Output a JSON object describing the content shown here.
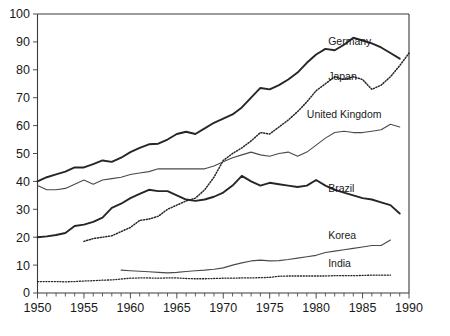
{
  "chart_data": {
    "type": "line",
    "title": "",
    "subtitle": "",
    "xlabel": "",
    "ylabel": "",
    "xlim": [
      1950,
      1990
    ],
    "ylim": [
      0,
      100
    ],
    "grid": false,
    "legend_position": "inline-right-labels",
    "x_ticks_major": [
      1950,
      1955,
      1960,
      1965,
      1970,
      1975,
      1980,
      1985,
      1990
    ],
    "x_tick_labels": [
      "1950",
      "1955",
      "1960",
      "1965",
      "1970",
      "1975",
      "1980",
      "1985",
      "1990"
    ],
    "x_tick_minor_step": 1,
    "y_ticks": [
      0,
      10,
      20,
      30,
      40,
      50,
      60,
      70,
      80,
      90,
      100
    ],
    "y_tick_labels": [
      "0",
      "10",
      "20",
      "30",
      "40",
      "50",
      "60",
      "70",
      "80",
      "90",
      "100"
    ],
    "series": [
      {
        "name": "Germany",
        "label": "Germany",
        "style": "solid-thick",
        "color": "#262626",
        "width": 1.9,
        "label_x": 1981.3,
        "label_y": 90.0,
        "x": [
          1950,
          1951,
          1952,
          1953,
          1954,
          1955,
          1956,
          1957,
          1958,
          1959,
          1960,
          1961,
          1962,
          1963,
          1964,
          1965,
          1966,
          1967,
          1968,
          1969,
          1970,
          1971,
          1972,
          1973,
          1974,
          1975,
          1976,
          1977,
          1978,
          1979,
          1980,
          1981,
          1982,
          1983,
          1984,
          1985,
          1986,
          1987,
          1988,
          1989
        ],
        "y": [
          40.0,
          41.5,
          42.5,
          43.5,
          45.0,
          45.0,
          46.2,
          47.5,
          47.0,
          48.5,
          50.5,
          52.0,
          53.3,
          53.5,
          55.0,
          57.0,
          57.8,
          57.0,
          59.0,
          61.0,
          62.5,
          64.0,
          66.5,
          70.0,
          73.5,
          73.0,
          74.5,
          76.5,
          79.0,
          82.5,
          85.5,
          87.5,
          87.0,
          89.0,
          91.5,
          90.5,
          89.5,
          88.0,
          86.0,
          84.0
        ]
      },
      {
        "name": "Japan",
        "label": "Japan",
        "style": "dotted",
        "color": "#262626",
        "width": 1.5,
        "label_x": 1981.3,
        "label_y": 77.5,
        "x": [
          1955,
          1956,
          1957,
          1958,
          1959,
          1960,
          1961,
          1962,
          1963,
          1964,
          1965,
          1966,
          1967,
          1968,
          1969,
          1970,
          1971,
          1972,
          1973,
          1974,
          1975,
          1976,
          1977,
          1978,
          1979,
          1980,
          1981,
          1982,
          1983,
          1984,
          1985,
          1986,
          1987,
          1988,
          1989,
          1990
        ],
        "y": [
          18.5,
          19.5,
          20.0,
          20.5,
          22.0,
          23.5,
          26.0,
          26.5,
          27.5,
          30.0,
          31.5,
          33.0,
          34.0,
          37.0,
          41.5,
          47.5,
          50.0,
          52.0,
          54.5,
          57.5,
          57.0,
          59.5,
          62.0,
          65.0,
          68.5,
          72.5,
          75.0,
          77.5,
          76.5,
          77.5,
          76.5,
          73.0,
          74.5,
          77.5,
          81.5,
          86.0
        ]
      },
      {
        "name": "United Kingdom",
        "label": "United Kingdom",
        "style": "solid-thin",
        "color": "#4a4a4a",
        "width": 1.1,
        "label_x": 1979.0,
        "label_y": 64.0,
        "x": [
          1950,
          1951,
          1952,
          1953,
          1954,
          1955,
          1956,
          1957,
          1958,
          1959,
          1960,
          1961,
          1962,
          1963,
          1964,
          1965,
          1966,
          1967,
          1968,
          1969,
          1970,
          1971,
          1972,
          1973,
          1974,
          1975,
          1976,
          1977,
          1978,
          1979,
          1980,
          1981,
          1982,
          1983,
          1984,
          1985,
          1986,
          1987,
          1988,
          1989
        ],
        "y": [
          38.5,
          37.0,
          37.0,
          37.5,
          39.0,
          40.5,
          39.0,
          40.5,
          41.0,
          41.5,
          42.5,
          43.0,
          43.5,
          44.5,
          44.5,
          44.5,
          44.5,
          44.5,
          44.5,
          45.5,
          47.0,
          48.5,
          49.5,
          50.5,
          49.5,
          49.0,
          50.0,
          50.5,
          49.0,
          50.5,
          53.0,
          55.5,
          57.5,
          58.0,
          57.5,
          57.5,
          58.0,
          58.5,
          60.5,
          59.5
        ]
      },
      {
        "name": "Brazil",
        "label": "Brazil",
        "style": "solid-thick",
        "color": "#262626",
        "width": 1.9,
        "label_x": 1981.3,
        "label_y": 37.5,
        "x": [
          1950,
          1951,
          1952,
          1953,
          1954,
          1955,
          1956,
          1957,
          1958,
          1959,
          1960,
          1961,
          1962,
          1963,
          1964,
          1965,
          1966,
          1967,
          1968,
          1969,
          1970,
          1971,
          1972,
          1973,
          1974,
          1975,
          1976,
          1977,
          1978,
          1979,
          1980,
          1981,
          1982,
          1983,
          1984,
          1985,
          1986,
          1987,
          1988,
          1989
        ],
        "y": [
          20.0,
          20.3,
          20.8,
          21.5,
          24.0,
          24.5,
          25.5,
          27.0,
          30.5,
          32.0,
          34.0,
          35.5,
          37.0,
          36.5,
          36.5,
          35.0,
          33.5,
          33.0,
          33.5,
          34.5,
          36.0,
          38.5,
          42.0,
          40.0,
          38.5,
          39.5,
          39.0,
          38.5,
          38.0,
          38.5,
          40.5,
          38.5,
          37.0,
          36.0,
          35.0,
          34.0,
          33.5,
          32.5,
          31.5,
          28.5
        ]
      },
      {
        "name": "Korea",
        "label": "Korea",
        "style": "solid-thin",
        "color": "#4a4a4a",
        "width": 1.1,
        "label_x": 1981.3,
        "label_y": 20.5,
        "x": [
          1959,
          1960,
          1961,
          1962,
          1963,
          1964,
          1965,
          1966,
          1967,
          1968,
          1969,
          1970,
          1971,
          1972,
          1973,
          1974,
          1975,
          1976,
          1977,
          1978,
          1979,
          1980,
          1981,
          1982,
          1983,
          1984,
          1985,
          1986,
          1987,
          1988
        ],
        "y": [
          8.2,
          8.0,
          7.8,
          7.6,
          7.4,
          7.2,
          7.4,
          7.7,
          8.0,
          8.2,
          8.5,
          9.0,
          10.0,
          10.8,
          11.5,
          11.8,
          11.5,
          11.6,
          12.0,
          12.5,
          13.0,
          13.5,
          14.5,
          15.0,
          15.5,
          16.0,
          16.5,
          17.0,
          17.0,
          19.0
        ]
      },
      {
        "name": "India",
        "label": "India",
        "style": "dotted",
        "color": "#262626",
        "width": 1.3,
        "label_x": 1981.3,
        "label_y": 10.5,
        "x": [
          1950,
          1951,
          1952,
          1953,
          1954,
          1955,
          1956,
          1957,
          1958,
          1959,
          1960,
          1961,
          1962,
          1963,
          1964,
          1965,
          1966,
          1967,
          1968,
          1969,
          1970,
          1971,
          1972,
          1973,
          1974,
          1975,
          1976,
          1977,
          1978,
          1979,
          1980,
          1981,
          1982,
          1983,
          1984,
          1985,
          1986,
          1987,
          1988
        ],
        "y": [
          4.1,
          4.1,
          4.1,
          4.0,
          4.1,
          4.3,
          4.4,
          4.6,
          4.7,
          5.0,
          5.3,
          5.4,
          5.4,
          5.3,
          5.4,
          5.4,
          5.2,
          5.1,
          5.1,
          5.2,
          5.3,
          5.3,
          5.4,
          5.4,
          5.5,
          5.6,
          6.0,
          6.1,
          6.1,
          6.1,
          6.1,
          6.1,
          6.2,
          6.2,
          6.2,
          6.3,
          6.4,
          6.4,
          6.4
        ]
      }
    ]
  }
}
